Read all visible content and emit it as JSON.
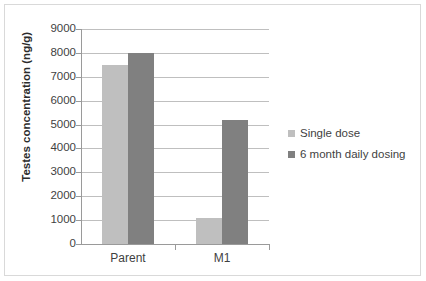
{
  "chart_data": {
    "type": "bar",
    "title": "",
    "xlabel": "",
    "ylabel": "Testes concentration (ng/g)",
    "categories": [
      "Parent",
      "M1"
    ],
    "series": [
      {
        "name": "Single dose",
        "values": [
          7500,
          1100
        ],
        "color": "#BFBFBF"
      },
      {
        "name": "6 month daily dosing",
        "values": [
          8000,
          5200
        ],
        "color": "#808080"
      }
    ],
    "ylim": [
      0,
      9000
    ],
    "yticks": [
      0,
      1000,
      2000,
      3000,
      4000,
      5000,
      6000,
      7000,
      8000,
      9000
    ],
    "ytick_labels": [
      "0",
      "1000",
      "2000",
      "3000",
      "4000",
      "5000",
      "6000",
      "7000",
      "8000",
      "9000"
    ],
    "grid": true,
    "legend_position": "right",
    "legend": [
      "Single dose",
      "6 month daily dosing"
    ]
  },
  "colors": {
    "single_dose": "#BFBFBF",
    "daily_dosing": "#808080",
    "gridline": "#BFBFBF",
    "axis": "#9A9A9A",
    "frame": "#D9D9D9",
    "text": "#3F3F3F"
  }
}
